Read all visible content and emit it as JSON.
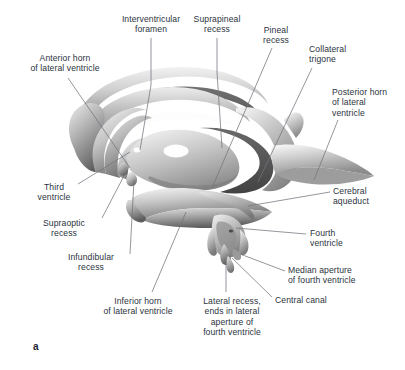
{
  "figure": {
    "panel_label": "a",
    "caption_text": "",
    "text_color": "#2b3340",
    "leader_color": "#6f747c",
    "background": "#ffffff"
  },
  "labels": [
    {
      "id": "interventricular-foramen",
      "text": "Interventricular\nforamen",
      "align": "center",
      "x": 95,
      "y": 14,
      "w": 112
    },
    {
      "id": "suprapineal-recess",
      "text": "Suprapineal\nrecess",
      "align": "center",
      "x": 177,
      "y": 14,
      "w": 80
    },
    {
      "id": "pineal-recess",
      "text": "Pineal\nrecess",
      "align": "center",
      "x": 248,
      "y": 25,
      "w": 56
    },
    {
      "id": "collateral-trigone",
      "text": "Collateral\ntrigone",
      "align": "left",
      "x": 309,
      "y": 44,
      "w": 78
    },
    {
      "id": "anterior-horn-of-lateral-ventricle",
      "text": "Anterior horn\nof lateral ventricle",
      "align": "center",
      "x": 13,
      "y": 53,
      "w": 104
    },
    {
      "id": "posterior-horn-of-lateral-ventricle",
      "text": "Posterior horn\nof lateral\nventricle",
      "align": "left",
      "x": 332,
      "y": 87,
      "w": 74
    },
    {
      "id": "third-ventricle",
      "text": "Third\nventricle",
      "align": "center",
      "x": 24,
      "y": 182,
      "w": 60
    },
    {
      "id": "cerebral-aqueduct",
      "text": "Cerebral\naqueduct",
      "align": "left",
      "x": 333,
      "y": 186,
      "w": 70
    },
    {
      "id": "supraoptic-recess",
      "text": "Supraoptic\nrecess",
      "align": "center",
      "x": 28,
      "y": 218,
      "w": 72
    },
    {
      "id": "fourth-ventricle",
      "text": "Fourth\nventricle",
      "align": "left",
      "x": 310,
      "y": 228,
      "w": 62
    },
    {
      "id": "infundibular-recess",
      "text": "Infundibular\nrecess",
      "align": "center",
      "x": 52,
      "y": 252,
      "w": 78
    },
    {
      "id": "median-aperture-of-fourth-ventricle",
      "text": "Median aperture\nof fourth ventricle",
      "align": "left",
      "x": 288,
      "y": 265,
      "w": 110
    },
    {
      "id": "central-canal",
      "text": "Central canal",
      "align": "left",
      "x": 275,
      "y": 295,
      "w": 82
    },
    {
      "id": "inferior-horn-of-lateral-ventricle",
      "text": "Inferior horn\nof lateral ventricle",
      "align": "center",
      "x": 86,
      "y": 296,
      "w": 104
    },
    {
      "id": "lateral-recess-fourth-ventricle",
      "text": "Lateral recess,\nends in lateral\naperture of\nfourth ventricle",
      "align": "center",
      "x": 186,
      "y": 296,
      "w": 92
    }
  ],
  "structures": [
    {
      "id": "body-of-lateral-ventricle",
      "name": "body of lateral ventricle"
    },
    {
      "id": "anterior-horn",
      "name": "anterior horn of lateral ventricle"
    },
    {
      "id": "third-ventricle-cavity",
      "name": "third ventricle"
    },
    {
      "id": "interthalamic-adhesion",
      "name": "interthalamic adhesion"
    },
    {
      "id": "posterior-horn",
      "name": "posterior horn of lateral ventricle"
    },
    {
      "id": "inferior-horn",
      "name": "inferior horn of lateral ventricle"
    },
    {
      "id": "cerebral-aqueduct-duct",
      "name": "cerebral aqueduct"
    },
    {
      "id": "fourth-ventricle-body",
      "name": "fourth ventricle"
    },
    {
      "id": "lateral-recess-limbs",
      "name": "lateral recesses"
    },
    {
      "id": "central-canal-stem",
      "name": "central canal"
    }
  ]
}
